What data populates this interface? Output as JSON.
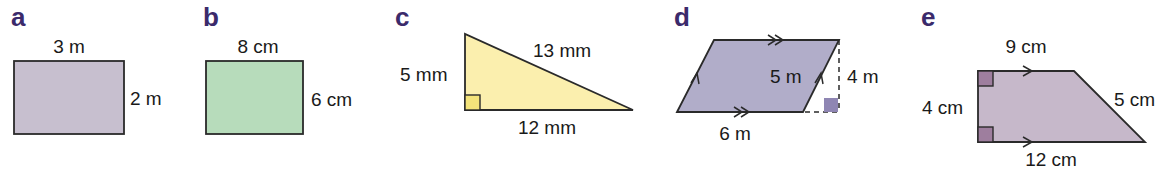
{
  "colors": {
    "label": "#3b2a6b",
    "outline": "#2a2a2a",
    "rect_a_fill": "#c7bfcf",
    "rect_b_fill": "#b7dcbb",
    "triangle_c_fill": "#fbefae",
    "parallelogram_d_fill": "#b1adc9",
    "parallelogram_d_right_angle": "#8f86b3",
    "trapezium_e_fill": "#c6b8ca",
    "trapezium_e_right_angle": "#9e7e9e"
  },
  "shapes": [
    {
      "label": "a",
      "type": "rectangle",
      "dims": {
        "top": "3 m",
        "right": "2 m"
      }
    },
    {
      "label": "b",
      "type": "rectangle",
      "dims": {
        "top": "8 cm",
        "right": "6 cm"
      }
    },
    {
      "label": "c",
      "type": "right triangle",
      "dims": {
        "left": "5 mm",
        "hypotenuse": "13 mm",
        "bottom": "12 mm"
      }
    },
    {
      "label": "d",
      "type": "parallelogram",
      "dims": {
        "slant": "5 m",
        "height": "4 m",
        "bottom": "6 m"
      }
    },
    {
      "label": "e",
      "type": "trapezium",
      "dims": {
        "top": "9 cm",
        "left": "4 cm",
        "slant": "5 cm",
        "bottom": "12 cm"
      }
    }
  ]
}
